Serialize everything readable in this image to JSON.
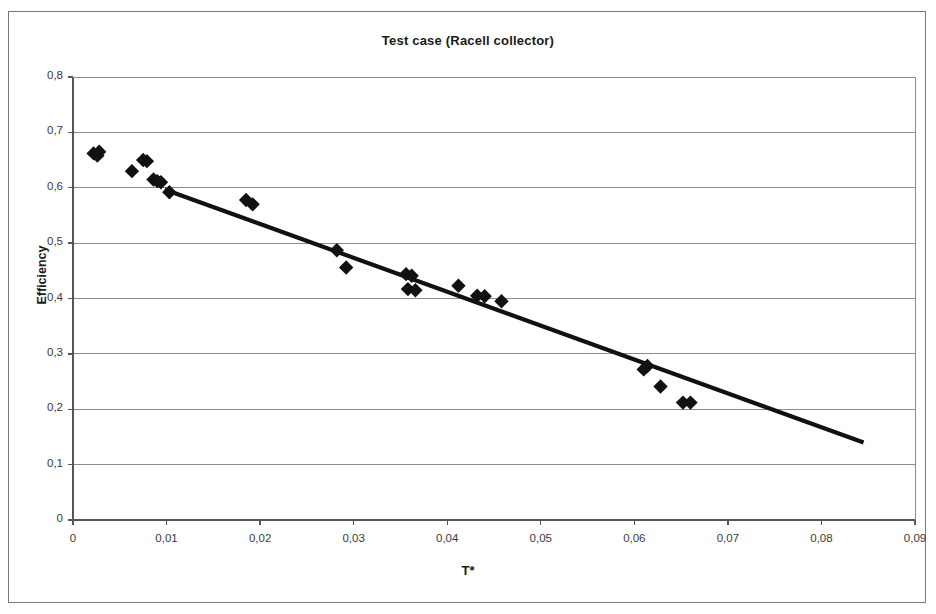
{
  "chart_data": {
    "type": "scatter",
    "title": "Test case (Racell collector)",
    "xlabel": "T*",
    "ylabel": "Efficiency",
    "xlim": [
      0,
      0.09
    ],
    "ylim": [
      0,
      0.8
    ],
    "xticks": [
      "0",
      "0,01",
      "0,02",
      "0,03",
      "0,04",
      "0,05",
      "0,06",
      "0,07",
      "0,08",
      "0,09"
    ],
    "xtick_values": [
      0,
      0.01,
      0.02,
      0.03,
      0.04,
      0.05,
      0.06,
      0.07,
      0.08,
      0.09
    ],
    "yticks": [
      "0",
      "0,1",
      "0,2",
      "0,3",
      "0,4",
      "0,5",
      "0,6",
      "0,7",
      "0,8"
    ],
    "ytick_values": [
      0,
      0.1,
      0.2,
      0.3,
      0.4,
      0.5,
      0.6,
      0.7,
      0.8
    ],
    "grid": "horizontal",
    "legend": "none",
    "marker": "diamond",
    "marker_color": "#111111",
    "line_color": "#111111",
    "series": [
      {
        "name": "Measured efficiency",
        "type": "scatter",
        "points": [
          [
            0.0022,
            0.662
          ],
          [
            0.0026,
            0.658
          ],
          [
            0.0028,
            0.665
          ],
          [
            0.0063,
            0.63
          ],
          [
            0.0075,
            0.65
          ],
          [
            0.0079,
            0.648
          ],
          [
            0.0086,
            0.615
          ],
          [
            0.009,
            0.612
          ],
          [
            0.0094,
            0.61
          ],
          [
            0.0103,
            0.592
          ],
          [
            0.0185,
            0.578
          ],
          [
            0.0192,
            0.57
          ],
          [
            0.0282,
            0.487
          ],
          [
            0.0292,
            0.456
          ],
          [
            0.0356,
            0.444
          ],
          [
            0.0362,
            0.441
          ],
          [
            0.0358,
            0.417
          ],
          [
            0.0366,
            0.415
          ],
          [
            0.0412,
            0.423
          ],
          [
            0.0432,
            0.405
          ],
          [
            0.044,
            0.404
          ],
          [
            0.0458,
            0.395
          ],
          [
            0.061,
            0.272
          ],
          [
            0.0614,
            0.278
          ],
          [
            0.0628,
            0.241
          ],
          [
            0.0652,
            0.212
          ],
          [
            0.066,
            0.212
          ]
        ]
      },
      {
        "name": "Linear trend",
        "type": "line",
        "points": [
          [
            0.0098,
            0.597
          ],
          [
            0.0845,
            0.14
          ]
        ]
      }
    ]
  },
  "figure": {
    "title": "Test case (Racell collector)",
    "x_axis_title": "T*",
    "y_axis_title": "Efficiency"
  }
}
